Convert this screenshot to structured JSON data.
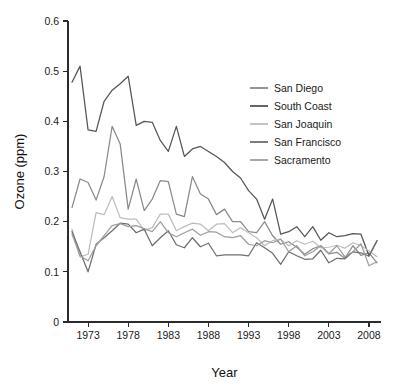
{
  "chart_data": {
    "type": "line",
    "title": "",
    "xlabel": "Year",
    "ylabel": "Ozone (ppm)",
    "xlim": [
      1970.5,
      2009.5
    ],
    "ylim": [
      0,
      0.6
    ],
    "xticks": [
      1973,
      1978,
      1983,
      1988,
      1993,
      1998,
      2003,
      2008
    ],
    "xtick_labels": [
      "1973",
      "1978",
      "1983",
      "1988",
      "1993",
      "1998",
      "2003",
      "2008"
    ],
    "yticks": [
      0,
      0.1,
      0.2,
      0.3,
      0.4,
      0.5,
      0.6
    ],
    "ytick_labels": [
      "0",
      "0.1",
      "0.2",
      "0.3",
      "0.4",
      "0.5",
      "0.6"
    ],
    "grid": false,
    "legend_position": "upper-right",
    "x": [
      1971,
      1972,
      1973,
      1974,
      1975,
      1976,
      1977,
      1978,
      1979,
      1980,
      1981,
      1982,
      1983,
      1984,
      1985,
      1986,
      1987,
      1988,
      1989,
      1990,
      1991,
      1992,
      1993,
      1994,
      1995,
      1996,
      1997,
      1998,
      1999,
      2000,
      2001,
      2002,
      2003,
      2004,
      2005,
      2006,
      2007,
      2008,
      2009
    ],
    "series": [
      {
        "name": "San Diego",
        "color": "#8a8a8a",
        "values": [
          0.228,
          0.285,
          0.278,
          0.243,
          0.29,
          0.39,
          0.355,
          0.225,
          0.285,
          0.222,
          0.245,
          0.282,
          0.28,
          0.215,
          0.21,
          0.29,
          0.255,
          0.245,
          0.214,
          0.225,
          0.2,
          0.2,
          0.18,
          0.178,
          0.2,
          0.172,
          0.155,
          0.16,
          0.149,
          0.135,
          0.146,
          0.152,
          0.136,
          0.139,
          0.127,
          0.152,
          0.133,
          0.138,
          0.118
        ]
      },
      {
        "name": "South Coast",
        "color": "#555555",
        "values": [
          0.478,
          0.51,
          0.383,
          0.38,
          0.44,
          0.462,
          0.475,
          0.49,
          0.392,
          0.4,
          0.398,
          0.362,
          0.34,
          0.39,
          0.33,
          0.345,
          0.35,
          0.34,
          0.33,
          0.318,
          0.3,
          0.287,
          0.262,
          0.245,
          0.205,
          0.245,
          0.175,
          0.18,
          0.19,
          0.17,
          0.19,
          0.163,
          0.178,
          0.17,
          0.172,
          0.176,
          0.175,
          0.132,
          0.162
        ]
      },
      {
        "name": "San Joaquin",
        "color": "#bdbdbd",
        "values": [
          0.185,
          0.13,
          0.135,
          0.218,
          0.214,
          0.25,
          0.208,
          0.205,
          0.205,
          0.182,
          0.188,
          0.215,
          0.215,
          0.182,
          0.19,
          0.197,
          0.195,
          0.182,
          0.195,
          0.196,
          0.178,
          0.188,
          0.178,
          0.168,
          0.152,
          0.162,
          0.165,
          0.152,
          0.162,
          0.155,
          0.161,
          0.148,
          0.149,
          0.153,
          0.147,
          0.158,
          0.152,
          0.142,
          0.13
        ]
      },
      {
        "name": "San Francisco",
        "color": "#6e6e6e",
        "values": [
          0.18,
          0.14,
          0.1,
          0.155,
          0.168,
          0.182,
          0.197,
          0.195,
          0.178,
          0.185,
          0.152,
          0.168,
          0.182,
          0.154,
          0.148,
          0.168,
          0.15,
          0.157,
          0.132,
          0.134,
          0.134,
          0.134,
          0.132,
          0.158,
          0.148,
          0.137,
          0.115,
          0.14,
          0.132,
          0.125,
          0.126,
          0.143,
          0.118,
          0.127,
          0.126,
          0.14,
          0.138,
          0.131,
          0.162
        ]
      },
      {
        "name": "Sacramento",
        "color": "#9e9e9e",
        "values": [
          0.175,
          0.132,
          0.122,
          0.152,
          0.172,
          0.192,
          0.196,
          0.19,
          0.192,
          0.186,
          0.18,
          0.2,
          0.178,
          0.17,
          0.178,
          0.185,
          0.173,
          0.18,
          0.179,
          0.17,
          0.168,
          0.172,
          0.155,
          0.152,
          0.162,
          0.158,
          0.165,
          0.14,
          0.152,
          0.132,
          0.14,
          0.152,
          0.136,
          0.152,
          0.13,
          0.14,
          0.156,
          0.112,
          0.12
        ]
      }
    ]
  },
  "legend": {
    "items": [
      {
        "label": "San Diego"
      },
      {
        "label": "South Coast"
      },
      {
        "label": "San Joaquin"
      },
      {
        "label": "San Francisco"
      },
      {
        "label": "Sacramento"
      }
    ]
  }
}
